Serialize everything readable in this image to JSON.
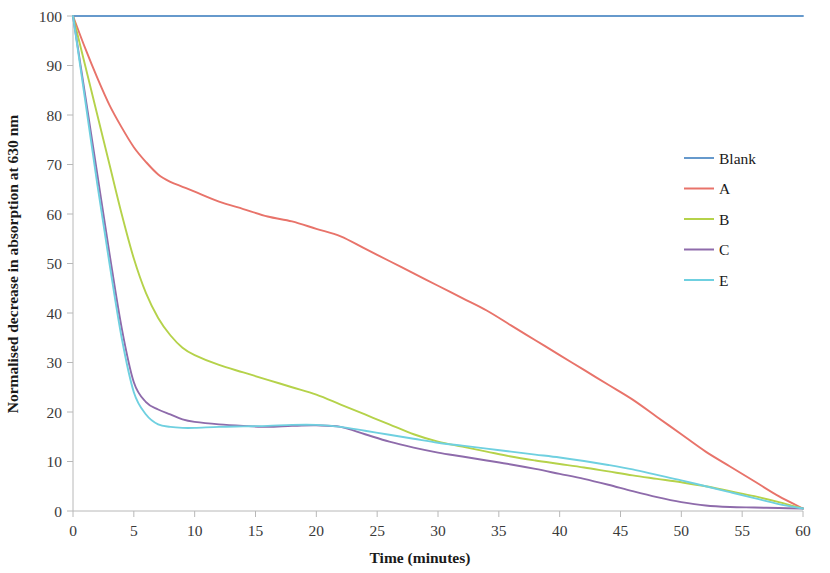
{
  "chart_data": {
    "type": "line",
    "title": "",
    "xlabel": "Time (minutes)",
    "ylabel": "Normalised decrease in absorption at 630 nm",
    "xlim": [
      0,
      60
    ],
    "ylim": [
      0,
      100
    ],
    "xticks": [
      0,
      5,
      10,
      15,
      20,
      25,
      30,
      35,
      40,
      45,
      50,
      55,
      60
    ],
    "yticks": [
      0,
      10,
      20,
      30,
      40,
      50,
      60,
      70,
      80,
      90,
      100
    ],
    "xtick_labels": [
      "0",
      "5",
      "10",
      "15",
      "20",
      "25",
      "30",
      "35",
      "40",
      "45",
      "50",
      "55",
      "60"
    ],
    "ytick_labels": [
      "0",
      "10",
      "20",
      "30",
      "40",
      "50",
      "60",
      "70",
      "80",
      "90",
      "100"
    ],
    "grid": false,
    "legend_position": "right",
    "x": [
      0,
      1,
      2,
      3,
      4,
      5,
      6,
      7,
      8,
      9,
      10,
      12,
      14,
      16,
      18,
      20,
      22,
      24,
      26,
      28,
      30,
      32,
      34,
      36,
      38,
      40,
      42,
      44,
      46,
      48,
      50,
      52,
      54,
      56,
      58,
      60
    ],
    "series": [
      {
        "name": "Blank",
        "color": "#6699cc",
        "values": [
          100,
          100,
          100,
          100,
          100,
          100,
          100,
          100,
          100,
          100,
          100,
          100,
          100,
          100,
          100,
          100,
          100,
          100,
          100,
          100,
          100,
          100,
          100,
          100,
          100,
          100,
          100,
          100,
          100,
          100,
          100,
          100,
          100,
          100,
          100,
          100
        ]
      },
      {
        "name": "A",
        "color": "#e8736a",
        "values": [
          100,
          93.5,
          87.5,
          82,
          77.5,
          73.5,
          70.5,
          68,
          66.5,
          65.5,
          64.5,
          62.5,
          61,
          59.5,
          58.5,
          57,
          55.5,
          53,
          50.5,
          48,
          45.5,
          43,
          40.5,
          37.5,
          34.5,
          31.5,
          28.5,
          25.5,
          22.5,
          19,
          15.5,
          12,
          9,
          6,
          3,
          0.5
        ]
      },
      {
        "name": "B",
        "color": "#b5d24a",
        "values": [
          100,
          90,
          80,
          70,
          60,
          51,
          44,
          39,
          35.5,
          33,
          31.5,
          29.5,
          28,
          26.5,
          25,
          23.5,
          21.5,
          19.5,
          17.5,
          15.5,
          14,
          13,
          12,
          11,
          10.2,
          9.5,
          8.8,
          8,
          7.2,
          6.5,
          5.8,
          5,
          4,
          3,
          1.8,
          0.5
        ]
      },
      {
        "name": "C",
        "color": "#8e6bab",
        "values": [
          100,
          84,
          68,
          52,
          37,
          26,
          22,
          20.5,
          19.5,
          18.5,
          18,
          17.5,
          17.2,
          17,
          17.2,
          17.3,
          17,
          15.5,
          14,
          12.8,
          11.8,
          11,
          10.2,
          9.4,
          8.5,
          7.5,
          6.5,
          5.3,
          4,
          2.8,
          1.8,
          1.1,
          0.8,
          0.7,
          0.6,
          0.5
        ]
      },
      {
        "name": "E",
        "color": "#6fd0e0",
        "values": [
          100,
          83,
          66,
          50,
          35,
          24,
          19.5,
          17.5,
          17,
          16.8,
          16.8,
          17,
          17.1,
          17.2,
          17.4,
          17.4,
          17,
          16.2,
          15.4,
          14.6,
          13.8,
          13.2,
          12.6,
          12,
          11.4,
          10.8,
          10.1,
          9.3,
          8.4,
          7.3,
          6.2,
          5,
          3.8,
          2.6,
          1.4,
          0.5
        ]
      }
    ]
  },
  "legend": {
    "entries": [
      {
        "label": "Blank"
      },
      {
        "label": "A"
      },
      {
        "label": "B"
      },
      {
        "label": "C"
      },
      {
        "label": "E"
      }
    ]
  },
  "axes": {
    "x_title": "Time (minutes)",
    "y_title": "Normalised decrease in absorption at 630 nm"
  }
}
